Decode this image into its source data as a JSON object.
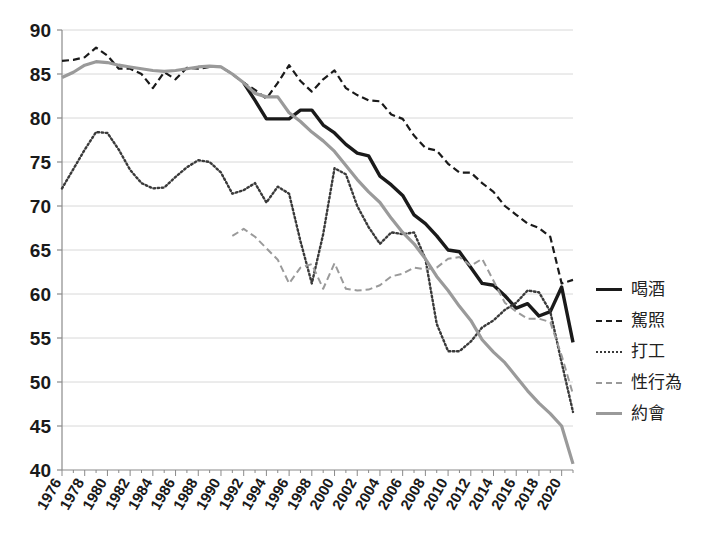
{
  "chart_data": {
    "type": "line",
    "title": "",
    "xlabel": "",
    "ylabel": "",
    "ylim": [
      40,
      90
    ],
    "ytick_step": 5,
    "yticks": [
      90,
      85,
      80,
      75,
      70,
      65,
      60,
      55,
      50,
      45,
      40
    ],
    "grid": true,
    "legend_position": "right",
    "x_start": 1976,
    "x_end": 2021,
    "xticks": [
      1976,
      1978,
      1980,
      1982,
      1984,
      1986,
      1988,
      1990,
      1992,
      1994,
      1996,
      1998,
      2000,
      2002,
      2004,
      2006,
      2008,
      2010,
      2012,
      2014,
      2016,
      2018,
      2020
    ],
    "xtick_rotation_deg": -60,
    "series": [
      {
        "name": "喝酒",
        "style": "solid",
        "color": "#1a1a1a",
        "width": 3.4,
        "x": [
          1992,
          1993,
          1994,
          1995,
          1996,
          1997,
          1998,
          1999,
          2000,
          2001,
          2002,
          2003,
          2004,
          2005,
          2006,
          2007,
          2008,
          2009,
          2010,
          2011,
          2012,
          2013,
          2014,
          2015,
          2016,
          2017,
          2018,
          2019,
          2020,
          2021
        ],
        "y": [
          84.0,
          82.0,
          79.9,
          79.9,
          79.9,
          80.9,
          80.9,
          79.2,
          78.3,
          77.0,
          76.0,
          75.7,
          73.4,
          72.4,
          71.2,
          69.0,
          68.0,
          66.6,
          65.0,
          64.8,
          63.0,
          61.2,
          61.0,
          59.8,
          58.4,
          58.9,
          57.5,
          58.0,
          60.8,
          54.5
        ]
      },
      {
        "name": "駕照",
        "style": "dashed",
        "color": "#1a1a1a",
        "width": 2.2,
        "x": [
          1976,
          1977,
          1978,
          1979,
          1980,
          1981,
          1982,
          1983,
          1984,
          1985,
          1986,
          1987,
          1988,
          1989,
          1990,
          1991,
          1992,
          1993,
          1994,
          1995,
          1996,
          1997,
          1998,
          1999,
          2000,
          2001,
          2002,
          2003,
          2004,
          2005,
          2006,
          2007,
          2008,
          2009,
          2010,
          2011,
          2012,
          2013,
          2014,
          2015,
          2016,
          2017,
          2018,
          2019,
          2020,
          2021
        ],
        "y": [
          86.5,
          86.6,
          86.9,
          88.0,
          87.1,
          85.6,
          85.6,
          85.0,
          83.4,
          85.2,
          84.4,
          85.7,
          85.6,
          85.8,
          85.8,
          85.0,
          84.0,
          83.2,
          82.2,
          84.0,
          86.0,
          84.2,
          83.0,
          84.4,
          85.4,
          83.4,
          82.6,
          82.0,
          81.9,
          80.4,
          79.9,
          78.0,
          76.6,
          76.3,
          74.8,
          73.8,
          73.8,
          72.6,
          71.6,
          70.0,
          69.0,
          68.0,
          67.5,
          66.5,
          61.2,
          61.6
        ]
      },
      {
        "name": "打工",
        "style": "dotted",
        "color": "#3a3a3a",
        "width": 2.4,
        "x": [
          1976,
          1977,
          1978,
          1979,
          1980,
          1981,
          1982,
          1983,
          1984,
          1985,
          1986,
          1987,
          1988,
          1989,
          1990,
          1991,
          1992,
          1993,
          1994,
          1995,
          1996,
          1997,
          1998,
          1999,
          2000,
          2001,
          2002,
          2003,
          2004,
          2005,
          2006,
          2007,
          2008,
          2009,
          2010,
          2011,
          2012,
          2013,
          2014,
          2015,
          2016,
          2017,
          2018,
          2019,
          2020,
          2021
        ],
        "y": [
          72.0,
          74.2,
          76.4,
          78.4,
          78.3,
          76.4,
          74.1,
          72.6,
          72.0,
          72.1,
          73.3,
          74.4,
          75.2,
          75.0,
          73.8,
          71.4,
          71.8,
          72.6,
          70.4,
          72.2,
          71.4,
          66.0,
          61.2,
          66.8,
          74.3,
          73.6,
          70.0,
          67.6,
          65.7,
          67.0,
          66.8,
          67.0,
          64.0,
          56.6,
          53.5,
          53.5,
          54.6,
          56.2,
          57.0,
          58.2,
          59.0,
          60.4,
          60.2,
          58.0,
          52.2,
          46.6
        ]
      },
      {
        "name": "性行為",
        "style": "dashed",
        "color": "#9a9a9a",
        "width": 2.0,
        "x": [
          1991,
          1992,
          1993,
          1994,
          1995,
          1996,
          1997,
          1998,
          1999,
          2000,
          2001,
          2002,
          2003,
          2004,
          2005,
          2006,
          2007,
          2008,
          2009,
          2010,
          2011,
          2012,
          2013,
          2014,
          2015,
          2016,
          2017,
          2018,
          2019,
          2020,
          2021
        ],
        "y": [
          66.6,
          67.4,
          66.5,
          65.2,
          63.9,
          61.2,
          63.0,
          63.4,
          60.6,
          63.5,
          60.6,
          60.4,
          60.5,
          61.0,
          62.0,
          62.3,
          63.0,
          62.8,
          63.0,
          64.0,
          64.2,
          63.2,
          64.0,
          61.5,
          59.0,
          58.0,
          57.2,
          57.2,
          56.8,
          53.0,
          48.6
        ]
      },
      {
        "name": "約會",
        "style": "solid",
        "color": "#9a9a9a",
        "width": 3.2,
        "x": [
          1976,
          1977,
          1978,
          1979,
          1980,
          1981,
          1982,
          1983,
          1984,
          1985,
          1986,
          1987,
          1988,
          1989,
          1990,
          1991,
          1992,
          1993,
          1994,
          1995,
          1996,
          1997,
          1998,
          1999,
          2000,
          2001,
          2002,
          2003,
          2004,
          2005,
          2006,
          2007,
          2008,
          2009,
          2010,
          2011,
          2012,
          2013,
          2014,
          2015,
          2016,
          2017,
          2018,
          2019,
          2020,
          2021
        ],
        "y": [
          84.6,
          85.2,
          86.0,
          86.4,
          86.3,
          86.0,
          85.8,
          85.6,
          85.4,
          85.3,
          85.4,
          85.6,
          85.8,
          85.9,
          85.8,
          85.0,
          84.0,
          82.8,
          82.4,
          82.4,
          80.6,
          79.6,
          78.4,
          77.4,
          76.2,
          74.6,
          73.0,
          71.6,
          70.4,
          68.6,
          67.0,
          65.7,
          64.0,
          62.0,
          60.4,
          58.6,
          57.0,
          54.8,
          53.4,
          52.2,
          50.6,
          49.0,
          47.6,
          46.4,
          45.0,
          40.7
        ]
      }
    ]
  },
  "legend": {
    "items": [
      {
        "label": "喝酒",
        "swatch": "lg-solid-dark"
      },
      {
        "label": "駕照",
        "swatch": "lg-dash-dark"
      },
      {
        "label": "打工",
        "swatch": "lg-dot-dark"
      },
      {
        "label": "性行為",
        "swatch": "lg-dash-gray"
      },
      {
        "label": "約會",
        "swatch": "lg-solid-gray"
      }
    ]
  }
}
